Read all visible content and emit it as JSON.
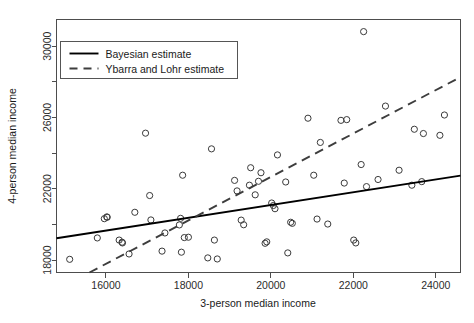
{
  "chart_data": {
    "type": "scatter",
    "title": "",
    "xlabel": "3-person median income",
    "ylabel": "4-person median income",
    "xlim": [
      14800,
      24600
    ],
    "ylim": [
      17300,
      31500
    ],
    "xticks": [
      16000,
      18000,
      20000,
      22000,
      24000
    ],
    "xtick_labels": [
      "16000",
      "18000",
      "20000",
      "22000",
      "24000"
    ],
    "yticks": [
      18000,
      22000,
      26000,
      30000
    ],
    "ytick_labels": [
      "18000",
      "22000",
      "26000",
      "30000"
    ],
    "minor_yticks": [
      20000,
      24000,
      28000
    ],
    "grid": false,
    "legend_position": "top-left",
    "legend": [
      {
        "label": "Bayesian estimate",
        "style": "solid",
        "color": "#000000"
      },
      {
        "label": "Ybarra and Lohr estimate",
        "style": "dashed",
        "color": "#3d3d3d"
      }
    ],
    "series": [
      {
        "name": "observations",
        "type": "scatter",
        "marker": "open-circle",
        "points": [
          [
            15120,
            18040
          ],
          [
            15790,
            19240
          ],
          [
            15960,
            20320
          ],
          [
            16020,
            20420
          ],
          [
            16030,
            20400
          ],
          [
            16320,
            19120
          ],
          [
            16390,
            19000
          ],
          [
            16400,
            18960
          ],
          [
            16560,
            18340
          ],
          [
            16700,
            20680
          ],
          [
            16960,
            25120
          ],
          [
            17060,
            21620
          ],
          [
            17090,
            20250
          ],
          [
            17360,
            18500
          ],
          [
            17430,
            19520
          ],
          [
            17780,
            19970
          ],
          [
            17810,
            20340
          ],
          [
            17830,
            18440
          ],
          [
            17860,
            22760
          ],
          [
            17900,
            19260
          ],
          [
            18000,
            19280
          ],
          [
            18470,
            18120
          ],
          [
            18560,
            24240
          ],
          [
            18630,
            19120
          ],
          [
            18700,
            18060
          ],
          [
            19120,
            22470
          ],
          [
            19180,
            21880
          ],
          [
            19280,
            20240
          ],
          [
            19340,
            19980
          ],
          [
            19480,
            22200
          ],
          [
            19510,
            23180
          ],
          [
            19620,
            21660
          ],
          [
            19700,
            22420
          ],
          [
            19760,
            22900
          ],
          [
            19860,
            18940
          ],
          [
            19900,
            19020
          ],
          [
            20020,
            21200
          ],
          [
            20060,
            21060
          ],
          [
            20100,
            20880
          ],
          [
            20160,
            23900
          ],
          [
            20360,
            22380
          ],
          [
            20410,
            18400
          ],
          [
            20480,
            20120
          ],
          [
            20520,
            20060
          ],
          [
            20900,
            25960
          ],
          [
            21040,
            22760
          ],
          [
            21120,
            20300
          ],
          [
            21200,
            24600
          ],
          [
            21380,
            20020
          ],
          [
            21700,
            25840
          ],
          [
            21780,
            22320
          ],
          [
            21840,
            25880
          ],
          [
            22010,
            19120
          ],
          [
            22060,
            18960
          ],
          [
            22190,
            23360
          ],
          [
            22250,
            30820
          ],
          [
            22320,
            22120
          ],
          [
            22600,
            22520
          ],
          [
            22780,
            26640
          ],
          [
            23110,
            23040
          ],
          [
            23420,
            22200
          ],
          [
            23480,
            25340
          ],
          [
            23660,
            22400
          ],
          [
            23700,
            25100
          ],
          [
            24100,
            25000
          ],
          [
            24210,
            26140
          ]
        ]
      },
      {
        "name": "Bayesian estimate",
        "type": "line",
        "style": "solid",
        "endpoints": [
          [
            14800,
            19220
          ],
          [
            24600,
            22740
          ]
        ]
      },
      {
        "name": "Ybarra and Lohr estimate",
        "type": "line",
        "style": "dashed",
        "endpoints": [
          [
            15600,
            17300
          ],
          [
            24600,
            28270
          ]
        ]
      }
    ]
  }
}
